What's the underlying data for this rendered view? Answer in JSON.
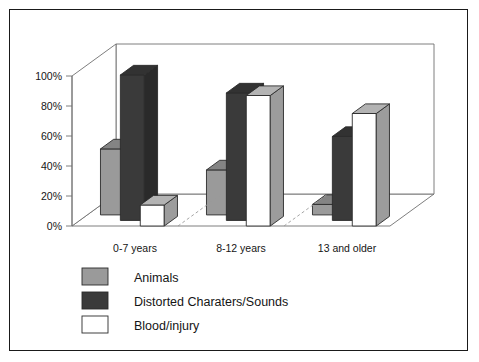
{
  "chart_data": {
    "type": "bar",
    "title": "",
    "subtitle": "",
    "xlabel": "",
    "ylabel": "",
    "categories": [
      "0-7 years",
      "8-12 years",
      "13 and older"
    ],
    "series": [
      {
        "name": "Animals",
        "color": "#9a9a9a",
        "values": [
          44,
          30,
          7
        ]
      },
      {
        "name": "Distorted Charaters/Sounds",
        "color": "#3a3a3a",
        "values": [
          97,
          85,
          56
        ]
      },
      {
        "name": "Blood/injury",
        "color": "#ffffff",
        "values": [
          14,
          87,
          75
        ]
      }
    ],
    "ylim": [
      0,
      100
    ],
    "yticks": [
      0,
      20,
      40,
      60,
      80,
      100
    ],
    "ytick_labels": [
      "0%",
      "20%",
      "40%",
      "60%",
      "80%",
      "100%"
    ],
    "grid": false,
    "legend_position": "bottom-left",
    "projection": "3d",
    "axis_color": "#6f6f6f",
    "text_color": "#151515",
    "frame_color": "#1a1a1a",
    "background": "#ffffff"
  },
  "legend": {
    "items": [
      {
        "label": "Animals",
        "swatch": "#9a9a9a"
      },
      {
        "label": "Distorted Charaters/Sounds",
        "swatch": "#3a3a3a"
      },
      {
        "label": "Blood/injury",
        "swatch": "#ffffff"
      }
    ]
  }
}
